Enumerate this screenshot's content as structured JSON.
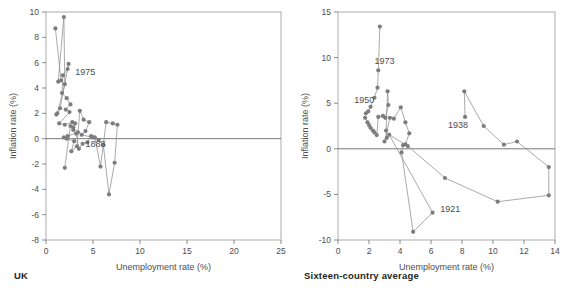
{
  "figure": {
    "background": "#ffffff",
    "marker_color": "#7d7d80",
    "line_color": "#8d8d8d",
    "axis_color": "#9a9a9a",
    "text_color": "#4d4d4f",
    "caption_color": "#231f20"
  },
  "panels": [
    {
      "caption": "UK"
    },
    {
      "caption": "Sixteen-country average"
    }
  ],
  "chart_data": [
    {
      "type": "scatter",
      "title": "UK",
      "xlabel": "Unemployment rate (%)",
      "ylabel": "Inflation rate (%)",
      "xlim": [
        0,
        25
      ],
      "ylim": [
        -8,
        10
      ],
      "xticks": [
        0,
        5,
        10,
        15,
        20,
        25
      ],
      "xtick_labels": [
        "0",
        "5",
        "10",
        "15",
        "20",
        "25"
      ],
      "yticks": [
        -8,
        -6,
        -4,
        -2,
        0,
        2,
        4,
        6,
        8,
        10
      ],
      "ytick_labels": [
        "-8",
        "-6",
        "-4",
        "-2",
        "0",
        "2",
        "4",
        "6",
        "8",
        "10"
      ],
      "grid": false,
      "legend": "none",
      "zero_line": 0,
      "connected": true,
      "annotations": [
        {
          "text": "1975",
          "x": 3.1,
          "y": 5.3
        },
        {
          "text": "1888",
          "x": 4.2,
          "y": -0.45
        }
      ],
      "x": [
        1.0,
        1.6,
        1.3,
        1.9,
        2.0,
        1.2,
        1.1,
        1.5,
        2.4,
        2.3,
        1.8,
        1.7,
        2.2,
        2.6,
        2.1,
        2.5,
        1.4,
        2.0,
        2.8,
        3.1,
        2.9,
        3.4,
        2.3,
        1.9,
        2.2,
        3.0,
        2.7,
        3.3,
        3.6,
        4.0,
        4.6,
        4.2,
        3.8,
        5.0,
        5.6,
        6.1,
        6.7,
        7.3,
        7.6,
        7.1,
        6.4,
        5.8,
        5.2,
        4.8,
        4.4,
        3.9,
        3.5,
        3.2,
        2.9,
        2.6,
        10.8,
        10.9,
        11.0,
        11.2,
        11.4,
        12.9,
        14.2,
        16.1,
        17.6,
        21.2,
        22.4,
        21.1,
        14.4,
        11.0,
        11.1,
        11.3,
        12.6
      ],
      "y": [
        8.7,
        4.6,
        4.5,
        9.6,
        4.3,
        2.0,
        1.9,
        2.4,
        5.9,
        5.5,
        5.0,
        3.6,
        3.2,
        2.7,
        2.3,
        2.1,
        1.2,
        1.1,
        1.3,
        1.2,
        0.9,
        0.5,
        0.2,
        0.1,
        0.0,
        -0.2,
        -1.0,
        -0.6,
        2.2,
        1.5,
        1.3,
        0.6,
        0.3,
        0.1,
        -0.1,
        -0.5,
        -0.9,
        -1.9,
        1.1,
        1.2,
        1.3,
        -2.2,
        0.1,
        0.2,
        -0.3,
        -0.4,
        -0.8,
        0.4,
        0.7,
        1.0,
        0.1,
        0.1,
        0.1,
        -2.1,
        -2.6,
        3.5,
        3.6,
        0.1,
        0.1,
        0.1,
        -3.2,
        -5.5,
        -5.9,
        -2.7,
        2.85,
        -2.7,
        3.0
      ],
      "path_order": [
        [
          1.0,
          8.7
        ],
        [
          1.6,
          4.6
        ],
        [
          1.3,
          4.5
        ],
        [
          1.9,
          9.6
        ],
        [
          2.0,
          4.3
        ],
        [
          1.2,
          2.0
        ],
        [
          1.1,
          1.9
        ],
        [
          1.5,
          2.4
        ],
        [
          2.4,
          5.9
        ],
        [
          2.3,
          5.5
        ],
        [
          1.8,
          5.0
        ],
        [
          1.7,
          3.6
        ],
        [
          2.2,
          3.2
        ],
        [
          2.6,
          2.7
        ],
        [
          2.1,
          2.3
        ],
        [
          2.5,
          2.1
        ],
        [
          1.4,
          1.2
        ],
        [
          2.0,
          1.1
        ],
        [
          2.8,
          1.3
        ],
        [
          3.1,
          1.2
        ],
        [
          2.9,
          0.9
        ],
        [
          3.4,
          0.5
        ],
        [
          2.3,
          0.2
        ],
        [
          1.9,
          0.1
        ],
        [
          2.2,
          0.0
        ],
        [
          3.0,
          -0.2
        ],
        [
          2.7,
          -1.0
        ],
        [
          3.3,
          -0.6
        ],
        [
          3.6,
          2.2
        ],
        [
          4.0,
          1.5
        ],
        [
          4.6,
          1.3
        ],
        [
          4.2,
          0.6
        ],
        [
          3.8,
          0.3
        ],
        [
          5.0,
          0.1
        ],
        [
          5.6,
          -0.1
        ],
        [
          6.1,
          -0.5
        ],
        [
          6.7,
          -4.4
        ],
        [
          7.3,
          -1.9
        ],
        [
          7.6,
          1.1
        ],
        [
          7.1,
          1.2
        ],
        [
          6.4,
          1.3
        ],
        [
          5.8,
          -2.2
        ],
        [
          5.2,
          0.1
        ],
        [
          4.8,
          0.2
        ],
        [
          4.4,
          -0.3
        ],
        [
          3.9,
          -0.4
        ],
        [
          3.5,
          -0.8
        ],
        [
          3.2,
          0.4
        ],
        [
          2.9,
          0.7
        ],
        [
          2.6,
          1.0
        ],
        [
          2.0,
          -2.3
        ]
      ]
    },
    {
      "type": "scatter",
      "title": "Sixteen-country average",
      "xlabel": "Unemployment rate (%)",
      "ylabel": "Inflation rate (%)",
      "xlim": [
        0,
        14
      ],
      "ylim": [
        -10,
        15
      ],
      "xticks": [
        0,
        2,
        4,
        6,
        8,
        10,
        12,
        14
      ],
      "xtick_labels": [
        "0",
        "2",
        "4",
        "6",
        "8",
        "10",
        "12",
        "14"
      ],
      "yticks": [
        -10,
        -5,
        0,
        5,
        10,
        15
      ],
      "ytick_labels": [
        "-10",
        "-5",
        "0",
        "5",
        "10",
        "15"
      ],
      "grid": false,
      "legend": "none",
      "zero_line": 0,
      "connected": true,
      "annotations": [
        {
          "text": "1973",
          "x": 2.35,
          "y": 9.6
        },
        {
          "text": "1950",
          "x": 1.05,
          "y": 5.4
        },
        {
          "text": "1938",
          "x": 7.1,
          "y": 2.6
        },
        {
          "text": "1921",
          "x": 6.6,
          "y": -6.6
        }
      ],
      "path_order": [
        [
          2.7,
          13.4
        ],
        [
          2.6,
          8.6
        ],
        [
          2.55,
          6.7
        ],
        [
          2.35,
          5.6
        ],
        [
          2.1,
          4.6
        ],
        [
          1.95,
          4.1
        ],
        [
          1.8,
          3.9
        ],
        [
          1.75,
          3.4
        ],
        [
          1.9,
          2.9
        ],
        [
          2.0,
          2.6
        ],
        [
          2.1,
          2.3
        ],
        [
          2.25,
          2.0
        ],
        [
          2.35,
          1.8
        ],
        [
          2.5,
          1.5
        ],
        [
          2.6,
          3.5
        ],
        [
          2.9,
          3.6
        ],
        [
          3.05,
          3.4
        ],
        [
          3.25,
          4.8
        ],
        [
          3.2,
          6.3
        ],
        [
          3.1,
          2.0
        ],
        [
          3.15,
          1.2
        ],
        [
          3.0,
          0.8
        ],
        [
          3.35,
          3.4
        ],
        [
          3.6,
          3.3
        ],
        [
          4.05,
          4.55
        ],
        [
          4.35,
          2.9
        ],
        [
          4.6,
          1.7
        ],
        [
          4.35,
          0.5
        ],
        [
          4.2,
          0.4
        ],
        [
          4.1,
          -0.4
        ],
        [
          4.85,
          -9.1
        ],
        [
          6.1,
          -7.0
        ],
        [
          3.3,
          1.55
        ],
        [
          4.5,
          0.3
        ],
        [
          6.9,
          -3.2
        ],
        [
          10.3,
          -5.8
        ],
        [
          13.6,
          -5.1
        ],
        [
          13.6,
          -2.0
        ],
        [
          11.55,
          0.8
        ],
        [
          10.7,
          0.45
        ],
        [
          9.4,
          2.5
        ],
        [
          8.15,
          6.3
        ],
        [
          8.2,
          3.5
        ]
      ]
    }
  ]
}
